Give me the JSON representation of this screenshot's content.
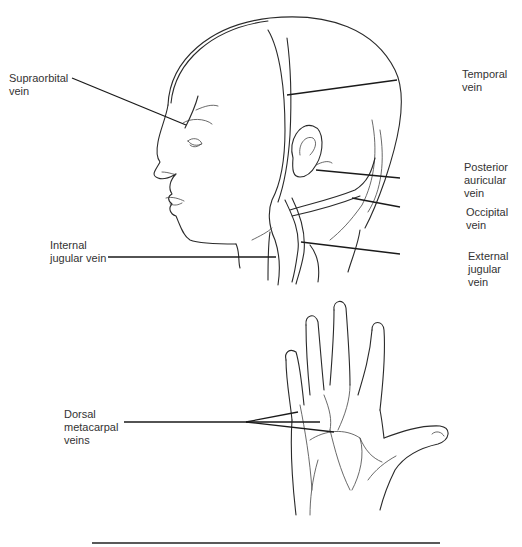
{
  "figure": {
    "head_labels": {
      "supraorbital": "Supraorbital\nvein",
      "temporal": "Temporal\nvein",
      "posterior_auricular": "Posterior\nauricular\nvein",
      "occipital": "Occipital\nvein",
      "internal_jugular": "Internal\njugular vein",
      "external_jugular": "External\njugular\nvein"
    },
    "hand_labels": {
      "dorsal_metacarpal": "Dorsal\nmetacarpal\nveins"
    }
  }
}
